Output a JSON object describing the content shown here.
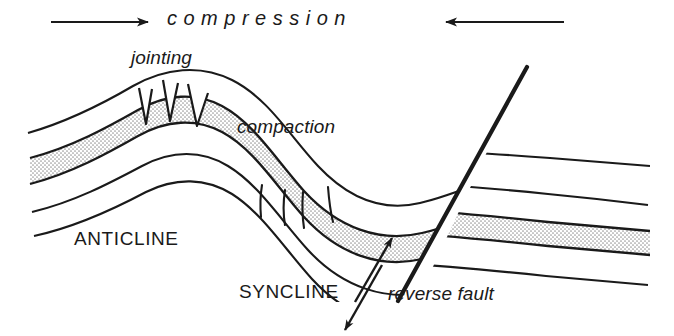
{
  "figure": {
    "width": 674,
    "height": 336,
    "background": "#ffffff",
    "ink_color": "#1a1a1a",
    "stipple_color": "#b9b9b9"
  },
  "labels": {
    "compression": "c o m p r e s s i o n",
    "compression_plain": "compression",
    "jointing": "jointing",
    "compaction": "compaction",
    "anticline": "ANTICLINE",
    "syncline": "SYNCLINE",
    "reverse_fault": "reverse fault"
  },
  "annotations": {
    "compression_arrow_left": "arrow-right",
    "compression_arrow_right": "arrow-left",
    "fault_slip_arrow_upper": "arrow-up-right",
    "fault_slip_arrow_lower": "arrow-down-left",
    "jointing_wedge_count": 3,
    "compaction_line_count": 4
  },
  "structures": [
    {
      "name": "anticline",
      "type": "fold",
      "sense": "upward-convex"
    },
    {
      "name": "syncline",
      "type": "fold",
      "sense": "downward-convex"
    },
    {
      "name": "reverse fault",
      "type": "fault",
      "sense": "reverse",
      "dip": "down-to-the-left"
    },
    {
      "name": "jointing",
      "type": "tension-joints",
      "location": "anticline crest"
    },
    {
      "name": "compaction",
      "type": "compaction-lines",
      "location": "syncline trough"
    }
  ]
}
